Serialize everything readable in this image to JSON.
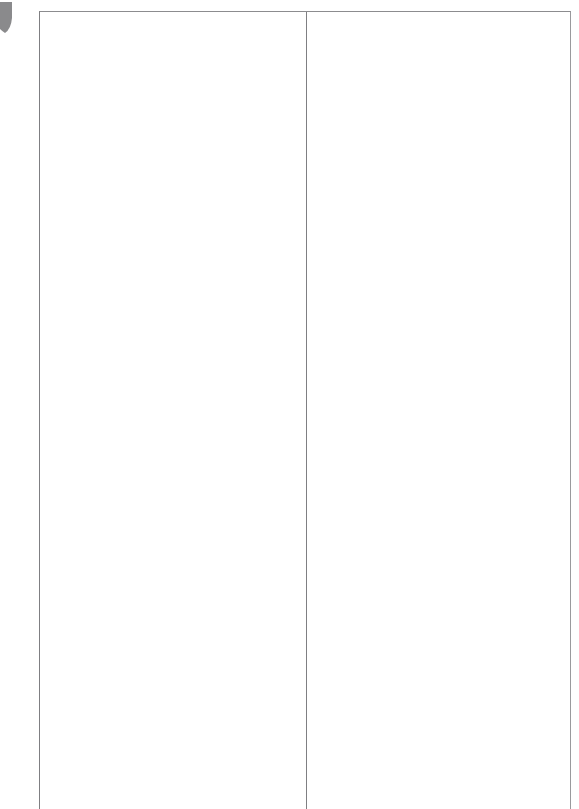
{
  "page": {
    "background_color": "#ffffff",
    "width_px": 579,
    "height_px": 809
  },
  "corner_mark": {
    "icon": "cut-off-shape-fragment",
    "color": "#8a8a8c",
    "description": "partial gray shape clipped by the left page edge"
  },
  "table": {
    "name": "two-column-layout-table",
    "border_color": "#8c8c8f",
    "background_color": "#ffffff",
    "column_count": 2,
    "row_count": 1,
    "columns": [
      {
        "name": "left-column",
        "content": ""
      },
      {
        "name": "right-column",
        "content": ""
      }
    ]
  }
}
